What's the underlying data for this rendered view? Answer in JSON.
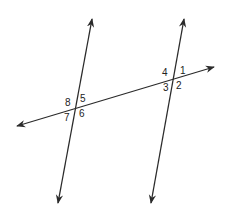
{
  "diagram": {
    "line_color": "#2b2b2b",
    "angle_labels": {
      "a1": "1",
      "a2": "2",
      "a3": "3",
      "a4": "4",
      "a5": "5",
      "a6": "6",
      "a7": "7",
      "a8": "8"
    }
  }
}
